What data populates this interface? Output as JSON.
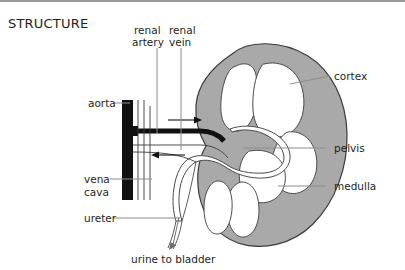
{
  "title": "STRUCTURE",
  "diagram": {
    "colors": {
      "cortex_fill": "#a9a9a9",
      "medulla_fill": "#ffffff",
      "vessel_dark": "#111111",
      "outline": "#3b3b3b",
      "leader_line": "#8d8d8d",
      "text": "#231f20",
      "background": "#ffffff",
      "top_rule": "#9a9a9a"
    },
    "labels": {
      "renal_artery": "renal\nartery",
      "renal_artery_line1": "renal",
      "renal_artery_line2": "artery",
      "renal_vein_line1": "renal",
      "renal_vein_line2": "vein",
      "aorta": "aorta",
      "vena_cava_line1": "vena",
      "vena_cava_line2": "cava",
      "ureter": "ureter",
      "cortex": "cortex",
      "pelvis": "pelvis",
      "medulla": "medulla",
      "urine_to_bladder": "urine to bladder"
    }
  }
}
